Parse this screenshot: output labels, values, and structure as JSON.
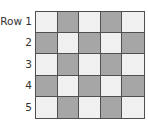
{
  "diagram": {
    "row_labels": [
      "Row 1",
      "2",
      "3",
      "4",
      "5"
    ],
    "colors": {
      "light": "#f0f0f0",
      "dark": "#a6a6a6",
      "border": "#505050"
    },
    "grid": [
      [
        "light",
        "dark",
        "light",
        "dark",
        "light"
      ],
      [
        "dark",
        "light",
        "dark",
        "light",
        "dark"
      ],
      [
        "light",
        "dark",
        "light",
        "dark",
        "light"
      ],
      [
        "dark",
        "light",
        "dark",
        "light",
        "dark"
      ],
      [
        "light",
        "dark",
        "light",
        "dark",
        "light"
      ]
    ]
  }
}
